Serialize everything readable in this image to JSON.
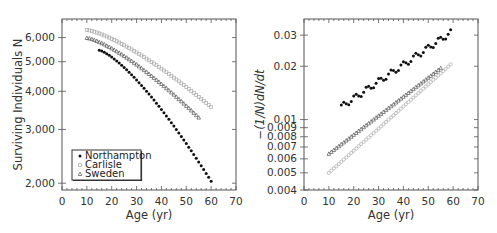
{
  "chart_data": [
    {
      "type": "scatter",
      "title": "",
      "xlabel": "Age (yr)",
      "ylabel": "Surviving Individuals N",
      "yscale": "log",
      "xlim": [
        0,
        70
      ],
      "ylim": [
        1900,
        6900
      ],
      "xticks": [
        0,
        10,
        20,
        30,
        40,
        50,
        60,
        70
      ],
      "yticks": [
        2000,
        3000,
        4000,
        5000,
        6000
      ],
      "ytick_labels": [
        "2,000",
        "3,000",
        "4,000",
        "5,000",
        "6,000"
      ],
      "legend": {
        "position": "lower left",
        "entries": [
          "Northampton",
          "Carlisle",
          "Sweden"
        ]
      },
      "series": [
        {
          "name": "Northampton",
          "marker": "filled-circle",
          "x_range": [
            15,
            60
          ],
          "y_start": 5450,
          "y_end": 2030
        },
        {
          "name": "Carlisle",
          "marker": "open-square",
          "x_range": [
            10,
            60
          ],
          "y_start": 6350,
          "y_end": 3550
        },
        {
          "name": "Sweden",
          "marker": "open-triangle",
          "x_range": [
            10,
            55
          ],
          "y_start": 5980,
          "y_end": 3280
        }
      ]
    },
    {
      "type": "scatter",
      "title": "",
      "xlabel": "Age (yr)",
      "ylabel": "−(1/N)dN/dt",
      "yscale": "log",
      "xlim": [
        0,
        70
      ],
      "ylim": [
        0.004,
        0.037
      ],
      "xticks": [
        0,
        10,
        20,
        30,
        40,
        50,
        60,
        70
      ],
      "yticks": [
        0.004,
        0.005,
        0.006,
        0.007,
        0.008,
        0.009,
        0.01,
        0.02,
        0.03
      ],
      "ytick_labels": [
        "0.004",
        "0.005",
        "0.006",
        "0.007",
        "0.008",
        "0.009",
        "0.01",
        "0.02",
        "0.03"
      ],
      "series": [
        {
          "name": "Northampton",
          "marker": "filled-circle",
          "x_range": [
            15,
            59
          ],
          "y_start": 0.0118,
          "y_end": 0.031
        },
        {
          "name": "Carlisle",
          "marker": "open-circle",
          "x_range": [
            10,
            59
          ],
          "y_start": 0.005,
          "y_end": 0.0205
        },
        {
          "name": "Sweden",
          "marker": "open-triangle",
          "x_range": [
            10,
            55
          ],
          "y_start": 0.0064,
          "y_end": 0.0195
        }
      ]
    }
  ]
}
